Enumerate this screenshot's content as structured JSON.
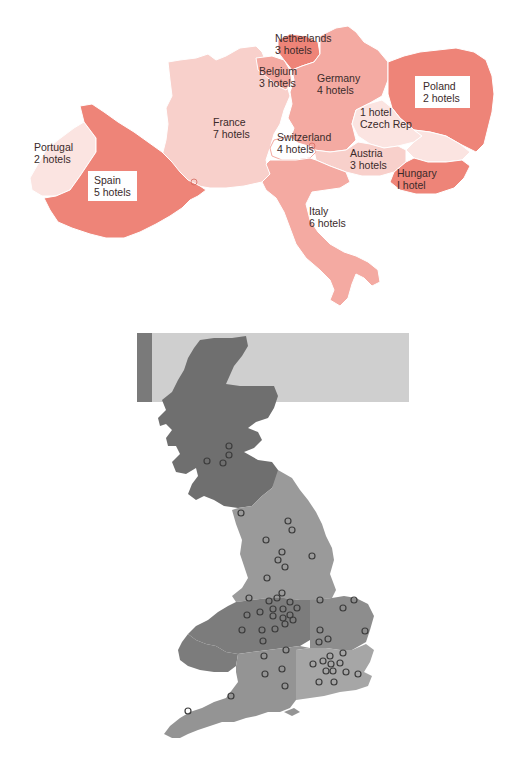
{
  "europe_map": {
    "colors": {
      "dark": "#ee8478",
      "medium": "#f4aaa2",
      "light": "#f8d0cb",
      "pale": "#fbe4e1"
    },
    "countries": [
      {
        "name": "Portugal",
        "hotels_label": "2 hotels",
        "hotels": 2
      },
      {
        "name": "Spain",
        "hotels_label": "5 hotels",
        "hotels": 5
      },
      {
        "name": "France",
        "hotels_label": "7 hotels",
        "hotels": 7
      },
      {
        "name": "Belgium",
        "hotels_label": "3 hotels",
        "hotels": 3
      },
      {
        "name": "Netherlands",
        "hotels_label": "3 hotels",
        "hotels": 3
      },
      {
        "name": "Germany",
        "hotels_label": "4 hotels",
        "hotels": 4
      },
      {
        "name": "Switzerland",
        "hotels_label": "4 hotels",
        "hotels": 4
      },
      {
        "name": "Italy",
        "hotels_label": "6 hotels",
        "hotels": 6
      },
      {
        "name": "Austria",
        "hotels_label": "3 hotels",
        "hotels": 3
      },
      {
        "name": "Czech Rep",
        "hotels_label": "1 hotel",
        "hotels": 1
      },
      {
        "name": "Hungary",
        "hotels_label": "I hotel",
        "hotels": 1
      },
      {
        "name": "Poland",
        "hotels_label": "2 hotels",
        "hotels": 2
      }
    ]
  },
  "uk_map": {
    "colors": {
      "scotland": "#6f6f6f",
      "north_england": "#9a9a9a",
      "midlands": "#7c7c7c",
      "east": "#8d8d8d",
      "south": "#949494",
      "southeast": "#a6a6a6",
      "banner": "#cfcfcf",
      "banner_strip": "#7a7a7a",
      "marker": "#3c3c3c"
    },
    "hotel_marker_count": 58
  }
}
